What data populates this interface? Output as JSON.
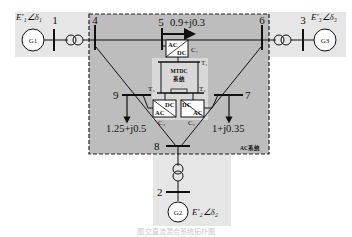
{
  "diagram": {
    "type": "power-system-single-line",
    "regions": {
      "ac_system_label": "AC系统",
      "mtdc_label_line1": "MTDC",
      "mtdc_label_line2": "系统"
    },
    "generators": [
      {
        "id": "G1",
        "label": "G1",
        "emf": "E′₁∠δ₁",
        "bus": "1"
      },
      {
        "id": "G2",
        "label": "G2",
        "emf": "E′₂∠δ₂",
        "bus": "2"
      },
      {
        "id": "G3",
        "label": "G3",
        "emf": "E′₃∠δ₃",
        "bus": "3"
      }
    ],
    "buses": [
      "1",
      "2",
      "3",
      "4",
      "5",
      "6",
      "7",
      "8",
      "9"
    ],
    "loads": [
      {
        "bus": "5",
        "value": "0.9+j0.3"
      },
      {
        "bus": "9",
        "value": "1.25+j0.5"
      },
      {
        "bus": "7",
        "value": "1+j0.35"
      }
    ],
    "converters": [
      {
        "id": "C1",
        "label": "C₁",
        "top": "AC",
        "bottom": "DC"
      },
      {
        "id": "C2",
        "label": "C₂",
        "top": "DC",
        "bottom": "AC"
      },
      {
        "id": "C3",
        "label": "C₃",
        "top": "DC",
        "bottom": "AC"
      }
    ],
    "dc_terminals": [
      {
        "id": "T1",
        "label": "T₁"
      },
      {
        "id": "T2",
        "label": "T₂"
      },
      {
        "id": "T3",
        "label": "T₃"
      }
    ],
    "caption": "图    交直流混合系统拓扑图"
  }
}
